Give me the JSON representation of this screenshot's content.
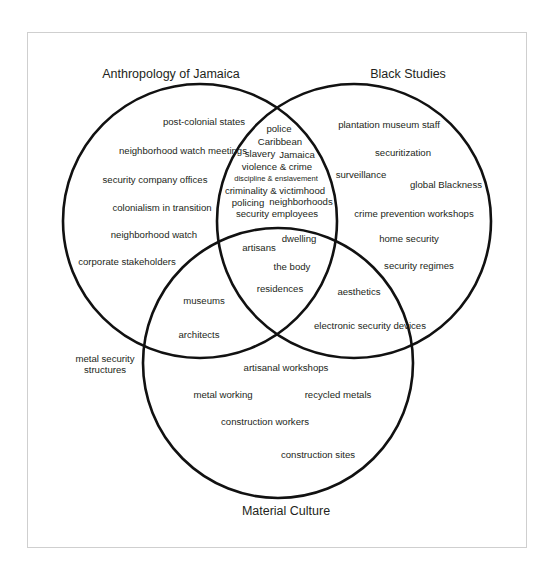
{
  "diagram": {
    "type": "venn",
    "sets": [
      {
        "id": "anthropology",
        "title": "Anthropology of Jamaica",
        "circle": {
          "cx": 200,
          "cy": 221,
          "r": 137
        },
        "title_pos": {
          "x": 171,
          "y": 78
        }
      },
      {
        "id": "black_studies",
        "title": "Black Studies",
        "circle": {
          "cx": 354,
          "cy": 221,
          "r": 137
        },
        "title_pos": {
          "x": 408,
          "y": 78
        }
      },
      {
        "id": "material_culture",
        "title": "Material Culture",
        "circle": {
          "cx": 278,
          "cy": 363,
          "r": 135
        },
        "title_pos": {
          "x": 286,
          "y": 515
        }
      }
    ],
    "regions": [
      {
        "id": "anthropology_only",
        "items": [
          {
            "label": "post-colonial states",
            "x": 204,
            "y": 125
          },
          {
            "label": "neighborhood watch meetings",
            "x": 183,
            "y": 154
          },
          {
            "label": "security company offices",
            "x": 155,
            "y": 183
          },
          {
            "label": "colonialism in transition",
            "x": 162,
            "y": 211
          },
          {
            "label": "neighborhood watch",
            "x": 154,
            "y": 238
          },
          {
            "label": "corporate stakeholders",
            "x": 127,
            "y": 265
          }
        ]
      },
      {
        "id": "black_studies_only",
        "items": [
          {
            "label": "plantation museum staff",
            "x": 389,
            "y": 128
          },
          {
            "label": "securitization",
            "x": 403,
            "y": 156
          },
          {
            "label": "surveillance",
            "x": 361,
            "y": 178
          },
          {
            "label": "global Blackness",
            "x": 446,
            "y": 188
          },
          {
            "label": "crime prevention workshops",
            "x": 414,
            "y": 217
          },
          {
            "label": "home security",
            "x": 409,
            "y": 242
          },
          {
            "label": "security regimes",
            "x": 419,
            "y": 269
          }
        ]
      },
      {
        "id": "anthropology_and_black_studies",
        "items": [
          {
            "label": "police",
            "x": 279,
            "y": 132
          },
          {
            "label": "Caribbean",
            "x": 280,
            "y": 145
          },
          {
            "label": "slavery",
            "x": 260,
            "y": 157
          },
          {
            "label": "Jamaica",
            "x": 297,
            "y": 158
          },
          {
            "label": "violence & crime",
            "x": 277,
            "y": 170
          },
          {
            "label": "discipline & enslavement",
            "x": 276,
            "y": 181,
            "small": true
          },
          {
            "label": "criminality & victimhood",
            "x": 275,
            "y": 194
          },
          {
            "label": "policing",
            "x": 248,
            "y": 206
          },
          {
            "label": "neighborhoods",
            "x": 301,
            "y": 205
          },
          {
            "label": "security employees",
            "x": 277,
            "y": 217
          }
        ]
      },
      {
        "id": "all_three",
        "items": [
          {
            "label": "dwelling",
            "x": 299,
            "y": 242
          },
          {
            "label": "artisans",
            "x": 259,
            "y": 251
          },
          {
            "label": "the body",
            "x": 292,
            "y": 270
          },
          {
            "label": "residences",
            "x": 280,
            "y": 292
          }
        ]
      },
      {
        "id": "anthropology_and_material_culture",
        "items": [
          {
            "label": "museums",
            "x": 204,
            "y": 304
          },
          {
            "label": "architects",
            "x": 199,
            "y": 338
          }
        ]
      },
      {
        "id": "black_studies_and_material_culture",
        "items": [
          {
            "label": "aesthetics",
            "x": 359,
            "y": 295
          },
          {
            "label": "electronic security devices",
            "x": 370,
            "y": 329
          }
        ]
      },
      {
        "id": "material_culture_only",
        "items": [
          {
            "label": "artisanal workshops",
            "x": 286,
            "y": 371
          },
          {
            "label": "metal working",
            "x": 223,
            "y": 398
          },
          {
            "label": "recycled metals",
            "x": 338,
            "y": 398
          },
          {
            "label": "construction workers",
            "x": 265,
            "y": 425
          },
          {
            "label": "construction sites",
            "x": 318,
            "y": 458
          }
        ]
      },
      {
        "id": "outside",
        "items": [
          {
            "label": "metal security",
            "x": 105,
            "y": 362
          },
          {
            "label": "structures",
            "x": 105,
            "y": 373
          }
        ]
      }
    ]
  }
}
